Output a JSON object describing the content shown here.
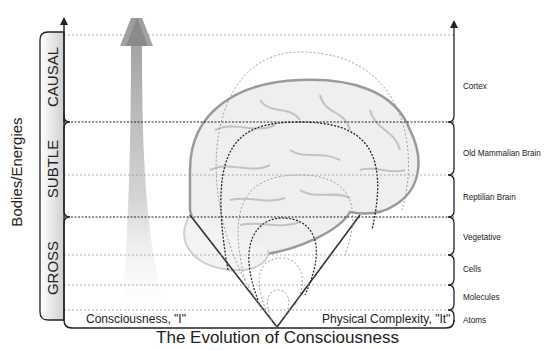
{
  "title": "The Evolution of Consciousness",
  "left_axis": {
    "label": "Bodies/Energies",
    "bands": [
      {
        "label": "CAUSAL"
      },
      {
        "label": "SUBTLE"
      },
      {
        "label": "GROSS"
      }
    ]
  },
  "baseline": {
    "left_label": "Consciousness, \"I\"",
    "right_label": "Physical Complexity, \"It\""
  },
  "right_axis": {
    "levels": [
      {
        "label": "Cortex"
      },
      {
        "label": "Old Mammalian Brain"
      },
      {
        "label": "Reptilian Brain"
      },
      {
        "label": "Vegetative"
      },
      {
        "label": "Cells"
      },
      {
        "label": "Molecules"
      },
      {
        "label": "Atoms"
      }
    ]
  },
  "colors": {
    "line": "#222222",
    "dotted": "#888888",
    "brain": "#bdbdbd",
    "arrow_top": "#8a8a8a",
    "band_fill": "#d9d9d9"
  }
}
